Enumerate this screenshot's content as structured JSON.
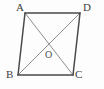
{
  "figure": {
    "kind": "geometry-diagram",
    "shape_name": "parallelogram",
    "background_color": "#fdfdfd",
    "edge_color": "#4a4a4a",
    "diagonal_color": "#8d8d8d",
    "label_color": "#3f3f3f",
    "vertices": [
      {
        "id": "A",
        "label": "A",
        "x": 25,
        "y": 13,
        "label_x": 16,
        "label_y": 2
      },
      {
        "id": "D",
        "label": "D",
        "x": 80,
        "y": 13,
        "label_x": 83,
        "label_y": 2
      },
      {
        "id": "C",
        "label": "C",
        "x": 73,
        "y": 75,
        "label_x": 75,
        "label_y": 69
      },
      {
        "id": "B",
        "label": "B",
        "x": 18,
        "y": 75,
        "label_x": 6,
        "label_y": 69
      }
    ],
    "center": {
      "id": "O",
      "label": "O",
      "x": 49,
      "y": 44,
      "label_x": 45,
      "label_y": 50
    },
    "edges": [
      {
        "id": "AD",
        "from": "A",
        "to": "D",
        "path": "M 25 13 L 80 13"
      },
      {
        "id": "DC",
        "from": "D",
        "to": "C",
        "path": "M 80 13 L 73 75"
      },
      {
        "id": "CB",
        "from": "C",
        "to": "B",
        "path": "M 73 75 L 18 75"
      },
      {
        "id": "BA",
        "from": "B",
        "to": "A",
        "path": "M 18 75 L 25 13"
      }
    ],
    "diagonals": [
      {
        "id": "AC",
        "from": "A",
        "to": "C",
        "path": "M 25 13 L 73 75"
      },
      {
        "id": "DB",
        "from": "D",
        "to": "B",
        "path": "M 80 13 L 18 75"
      }
    ]
  }
}
